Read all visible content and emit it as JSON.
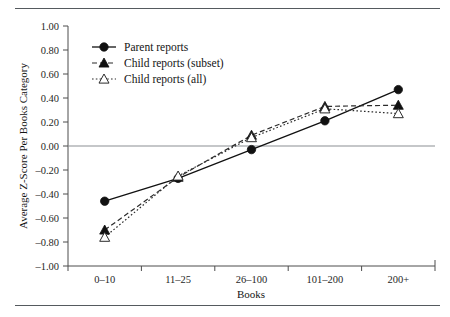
{
  "figure": {
    "has_top_rule": true,
    "has_bottom_rule": true,
    "rule_color": "#555a5e",
    "background": "#ffffff"
  },
  "chart_data": {
    "type": "line",
    "title": "",
    "xlabel": "Books",
    "ylabel": "Average Z-Score Per Books Category",
    "categories": [
      "0–10",
      "11–25",
      "26–100",
      "101–200",
      "200+"
    ],
    "ylim": [
      -1.0,
      1.0
    ],
    "ytick_labels": [
      "1.00",
      "0.80",
      "0.60",
      "0.40",
      "0.20",
      "0.00",
      "–0.20",
      "–0.40",
      "–0.60",
      "–0.80",
      "–1.00"
    ],
    "ytick_values": [
      1.0,
      0.8,
      0.6,
      0.4,
      0.2,
      0.0,
      -0.2,
      -0.4,
      -0.6,
      -0.8,
      -1.0
    ],
    "grid": false,
    "zero_line": true,
    "legend_position": "upper-left-inside",
    "series": [
      {
        "name": "Parent reports",
        "marker": "filled-circle",
        "line": "solid",
        "color": "#111111",
        "values": [
          -0.46,
          -0.27,
          -0.03,
          0.21,
          0.47
        ]
      },
      {
        "name": "Child reports (subset)",
        "marker": "filled-triangle",
        "line": "dashed",
        "color": "#2b2b2b",
        "values": [
          -0.7,
          -0.26,
          0.09,
          0.33,
          0.34
        ]
      },
      {
        "name": "Child reports (all)",
        "marker": "open-triangle",
        "line": "dotted",
        "color": "#2b2b2b",
        "values": [
          -0.76,
          -0.25,
          0.07,
          0.31,
          0.27
        ]
      }
    ]
  }
}
